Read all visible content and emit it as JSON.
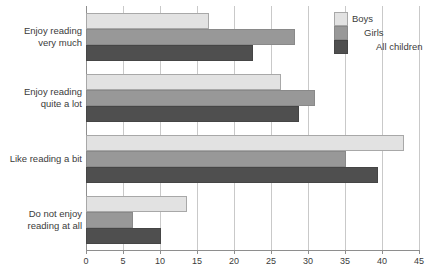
{
  "chart_data": {
    "type": "bar",
    "orientation": "horizontal",
    "title": "",
    "subtitle": "",
    "xlabel": "",
    "ylabel": "",
    "xlim": [
      0,
      45
    ],
    "xticks": [
      0,
      5,
      10,
      15,
      20,
      25,
      30,
      35,
      40,
      45
    ],
    "xtick_labels": [
      "0",
      "5",
      "10",
      "15",
      "20",
      "25",
      "30",
      "35",
      "40",
      "45"
    ],
    "grid": true,
    "grid_axis": "x",
    "legend_position": "top-right",
    "categories": [
      "Enjoy reading\nvery much",
      "Enjoy reading\nquite a lot",
      "Like reading a bit",
      "Do not enjoy\nreading at all"
    ],
    "category_lines": [
      [
        "Enjoy reading",
        "very much"
      ],
      [
        "Enjoy reading",
        "quite a lot"
      ],
      [
        "Like reading a bit"
      ],
      [
        "Do not enjoy",
        "reading at all"
      ]
    ],
    "series": [
      {
        "name": "Boys",
        "color": "#e2e2e2",
        "values": [
          16.6,
          26.4,
          43.0,
          13.7
        ]
      },
      {
        "name": "Girls",
        "color": "#989898",
        "values": [
          28.2,
          31.0,
          35.2,
          6.4
        ]
      },
      {
        "name": "All children",
        "color": "#4f4f4f",
        "values": [
          22.5,
          28.8,
          39.5,
          10.2
        ]
      }
    ]
  },
  "legend": {
    "entries": [
      {
        "label": "Boys",
        "color": "#e2e2e2"
      },
      {
        "label": "Girls",
        "color": "#989898"
      },
      {
        "label": "All children",
        "color": "#4f4f4f"
      }
    ]
  },
  "axis": {
    "x_tick_labels": [
      "0",
      "5",
      "10",
      "15",
      "20",
      "25",
      "30",
      "35",
      "40",
      "45"
    ]
  },
  "colors": {
    "boys": "#e2e2e2",
    "girls": "#989898",
    "all_children": "#4f4f4f",
    "gridline": "#c9c9c9",
    "axis": "#8e8e8e",
    "text": "#3b3b3b",
    "background": "#ffffff"
  }
}
